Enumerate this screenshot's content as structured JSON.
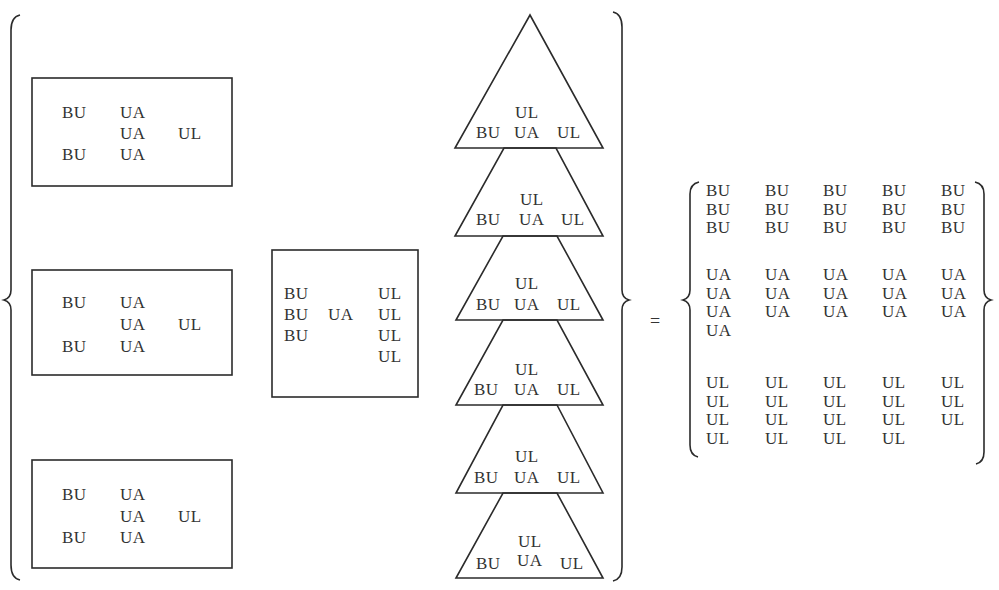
{
  "diagram": {
    "stroke_color": "#2b2b2b",
    "text_color": "#333333",
    "rect_groups": [
      {
        "rows": [
          [
            "BU",
            "UA",
            ""
          ],
          [
            "",
            "UA",
            "UL"
          ],
          [
            "BU",
            "UA",
            ""
          ]
        ]
      },
      {
        "rows": [
          [
            "BU",
            "UA",
            ""
          ],
          [
            "",
            "UA",
            "UL"
          ],
          [
            "BU",
            "UA",
            ""
          ]
        ]
      },
      {
        "rows": [
          [
            "BU",
            "UA",
            ""
          ],
          [
            "",
            "UA",
            "UL"
          ],
          [
            "BU",
            "UA",
            ""
          ]
        ]
      }
    ],
    "square_group": {
      "rows": [
        [
          "BU",
          "",
          "UL"
        ],
        [
          "BU",
          "UA",
          "UL"
        ],
        [
          "BU",
          "",
          "UL"
        ],
        [
          "",
          "",
          "UL"
        ]
      ]
    },
    "triangle_stack": [
      {
        "top": "UL",
        "bottom": [
          "BU",
          "UA",
          "UL"
        ]
      },
      {
        "top": "UL",
        "bottom": [
          "BU",
          "UA",
          "UL"
        ]
      },
      {
        "top": "UL",
        "bottom": [
          "BU",
          "UA",
          "UL"
        ]
      },
      {
        "top": "UL",
        "bottom": [
          "BU",
          "UA",
          "UL"
        ]
      },
      {
        "top": "UL",
        "bottom": [
          "BU",
          "UA",
          "UL"
        ]
      },
      {
        "top": "UL",
        "bottom": [
          "BU",
          "UA",
          "UL"
        ]
      }
    ],
    "equals_sign": "=",
    "result_set": {
      "bu_rows": [
        [
          "BU",
          "BU",
          "BU",
          "BU",
          "BU"
        ],
        [
          "BU",
          "BU",
          "BU",
          "BU",
          "BU"
        ],
        [
          "BU",
          "BU",
          "BU",
          "BU",
          "BU"
        ]
      ],
      "ua_rows": [
        [
          "UA",
          "UA",
          "UA",
          "UA",
          "UA"
        ],
        [
          "UA",
          "UA",
          "UA",
          "UA",
          "UA"
        ],
        [
          "UA",
          "UA",
          "UA",
          "UA",
          "UA"
        ],
        [
          "UA",
          "",
          "",
          "",
          ""
        ]
      ],
      "ul_rows": [
        [
          "UL",
          "UL",
          "UL",
          "UL",
          "UL"
        ],
        [
          "UL",
          "UL",
          "UL",
          "UL",
          "UL"
        ],
        [
          "UL",
          "UL",
          "UL",
          "UL",
          "UL"
        ],
        [
          "UL",
          "UL",
          "UL",
          "UL",
          ""
        ]
      ],
      "counts": {
        "BU": 15,
        "UA": 16,
        "UL": 19
      }
    }
  }
}
